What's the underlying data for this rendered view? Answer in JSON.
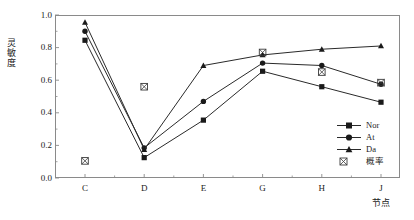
{
  "chart_data": {
    "type": "line",
    "title": "",
    "xlabel": "节点",
    "ylabel": "灵敏度",
    "categories": [
      "C",
      "D",
      "E",
      "G",
      "H",
      "J"
    ],
    "ylim": [
      0.0,
      1.0
    ],
    "yticks": [
      "0.0",
      "0.2",
      "0.4",
      "0.6",
      "0.8",
      "1.0"
    ],
    "ytick_values": [
      0.0,
      0.2,
      0.4,
      0.6,
      0.8,
      1.0
    ],
    "grid": false,
    "legend_position": "lower-right",
    "series": [
      {
        "name": "Nor",
        "marker": "square",
        "values": [
          0.845,
          0.125,
          0.355,
          0.655,
          0.56,
          0.465
        ]
      },
      {
        "name": "At",
        "marker": "circle",
        "values": [
          0.9,
          0.185,
          0.47,
          0.705,
          0.69,
          0.575
        ]
      },
      {
        "name": "Da",
        "marker": "triangle",
        "values": [
          0.955,
          0.175,
          0.69,
          0.755,
          0.79,
          0.81
        ]
      },
      {
        "name": "概率",
        "marker": "crossed-square",
        "line": false,
        "values": [
          0.105,
          0.56,
          null,
          0.77,
          0.65,
          0.585
        ]
      }
    ]
  },
  "axis": {
    "ylabel_chars": [
      "灵",
      "敏",
      "度"
    ]
  },
  "legend": {
    "items": [
      {
        "label": "Nor",
        "marker": "square-line-icon"
      },
      {
        "label": "At",
        "marker": "circle-line-icon"
      },
      {
        "label": "Da",
        "marker": "triangle-line-icon"
      },
      {
        "label": "概率",
        "marker": "crossed-square-icon"
      }
    ]
  },
  "colors": {
    "line": "#2a2a2a",
    "marker": "#1a1a1a",
    "frame": "#8a8a8a",
    "text": "#1a1a1a",
    "background": "#ffffff"
  }
}
